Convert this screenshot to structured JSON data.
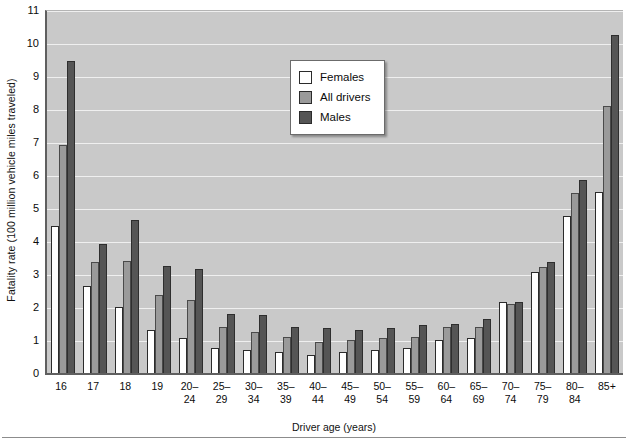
{
  "chart_data": {
    "type": "bar",
    "title": "",
    "xlabel": "Driver age (years)",
    "ylabel": "Fatality rate (100 million vehicle miles traveled)",
    "ylim": [
      0,
      11
    ],
    "yticks": [
      0,
      1,
      2,
      3,
      4,
      5,
      6,
      7,
      8,
      9,
      10,
      11
    ],
    "grid": true,
    "legend_position": "upper-center",
    "categories": [
      "16",
      "17",
      "18",
      "19",
      "20–\n24",
      "25–\n29",
      "30–\n34",
      "35–\n39",
      "40–\n44",
      "45–\n49",
      "50–\n54",
      "55–\n59",
      "60–\n64",
      "65–\n69",
      "70–\n74",
      "75–\n79",
      "80–\n84",
      "85+"
    ],
    "series": [
      {
        "name": "Females",
        "color": "#ffffff",
        "values": [
          4.45,
          2.65,
          2.0,
          1.3,
          1.05,
          0.75,
          0.7,
          0.65,
          0.55,
          0.65,
          0.7,
          0.75,
          1.0,
          1.05,
          2.15,
          3.05,
          4.75,
          5.5
        ]
      },
      {
        "name": "All drivers",
        "color": "#9a9a9a",
        "values": [
          6.9,
          3.35,
          3.4,
          2.35,
          2.2,
          1.4,
          1.25,
          1.1,
          0.95,
          1.0,
          1.05,
          1.1,
          1.4,
          1.4,
          2.1,
          3.2,
          5.45,
          8.1
        ]
      },
      {
        "name": "Males",
        "color": "#555555",
        "values": [
          9.45,
          3.9,
          4.65,
          3.25,
          3.15,
          1.8,
          1.75,
          1.4,
          1.35,
          1.3,
          1.35,
          1.45,
          1.5,
          1.65,
          2.15,
          3.35,
          5.85,
          10.25
        ]
      }
    ]
  },
  "legend": {
    "items": [
      {
        "label": "Females",
        "swatch": "white-square-icon"
      },
      {
        "label": "All drivers",
        "swatch": "gray-square-icon"
      },
      {
        "label": "Males",
        "swatch": "dark-gray-square-icon"
      }
    ]
  },
  "colors": {
    "plot_background": "#c9c9c9",
    "gridline": "#efefef",
    "axis": "#5f5f5f"
  }
}
